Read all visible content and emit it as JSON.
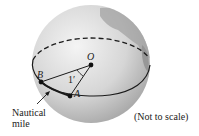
{
  "diagram": {
    "labels": {
      "O": "O",
      "B": "B",
      "A": "A",
      "angle": "1′",
      "nautical_line1": "Nautical",
      "nautical_line2": "mile",
      "note": "(Not to scale)"
    },
    "colors": {
      "globe_light": "#f2f2f2",
      "globe_dark": "#a9a9a9",
      "land": "#9a9a9a",
      "line": "#1a1a1a"
    }
  }
}
